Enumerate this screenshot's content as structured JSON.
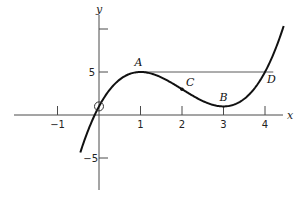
{
  "chart_data": {
    "type": "line",
    "title": "",
    "function": "y = x^3 - 6x^2 + 9x + 1",
    "xlabel": "x",
    "ylabel": "y",
    "xlim": [
      -2,
      4.5
    ],
    "ylim": [
      -8,
      11
    ],
    "x_ticks": [
      {
        "value": -1,
        "label": "-1"
      },
      {
        "value": 1,
        "label": "1"
      },
      {
        "value": 2,
        "label": "2"
      },
      {
        "value": 3,
        "label": "3"
      },
      {
        "value": 4,
        "label": "4"
      }
    ],
    "y_ticks": [
      {
        "value": 5,
        "label": "5"
      },
      {
        "value": 10,
        "label": ""
      },
      {
        "value": -5,
        "label": "-5"
      }
    ],
    "curve_domain": [
      -0.45,
      4.45
    ],
    "points": [
      {
        "name": "A",
        "x": 1,
        "y": 5,
        "marker": false
      },
      {
        "name": "B",
        "x": 3,
        "y": 1,
        "marker": false
      },
      {
        "name": "C",
        "x": 2,
        "y": 3,
        "marker": true
      },
      {
        "name": "D",
        "x": 4,
        "y": 5,
        "marker": false
      }
    ],
    "origin_circle": {
      "x": 0,
      "y": 1
    },
    "reference_line": {
      "from_x": 1,
      "to_x": 4.2,
      "y": 5
    },
    "grid": false,
    "legend": "none"
  }
}
